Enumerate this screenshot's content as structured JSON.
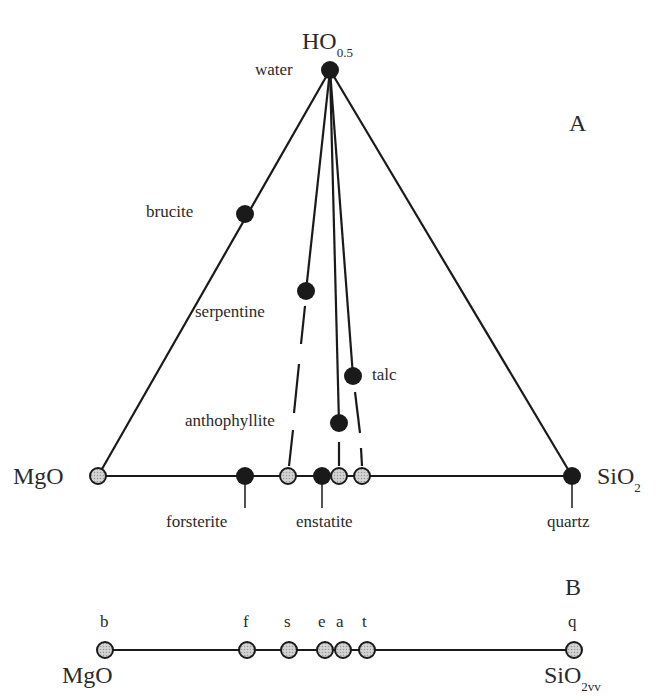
{
  "panel_a": {
    "label": "A",
    "apex": {
      "formula": "HO",
      "subscript": "0.5",
      "mineral": "water"
    },
    "left_vertex": {
      "formula": "MgO"
    },
    "right_vertex": {
      "formula": "SiO",
      "subscript": "2",
      "mineral": "quartz"
    },
    "minerals": {
      "brucite": "brucite",
      "serpentine": "serpentine",
      "talc": "talc",
      "anthophyllite": "anthophyllite",
      "forsterite": "forsterite",
      "enstatite": "enstatite"
    }
  },
  "panel_b": {
    "label": "B",
    "left": {
      "formula": "MgO"
    },
    "right": {
      "formula": "SiO",
      "subscript": "2vv"
    },
    "points": [
      "b",
      "f",
      "s",
      "e",
      "a",
      "t",
      "q"
    ]
  },
  "colors": {
    "line": "#1a1a1a",
    "solid_point": "#1a1a1a",
    "projected_point": "#bdbdbd"
  }
}
